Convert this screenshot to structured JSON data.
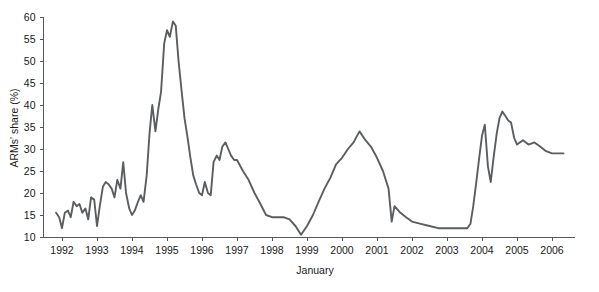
{
  "chart_data": {
    "type": "line",
    "title": "",
    "subtitle": "",
    "xlabel": "January",
    "ylabel": "ARMs' share (%)",
    "xlim": [
      1991.75,
      2006.6
    ],
    "ylim": [
      8.5,
      61.5
    ],
    "grid": false,
    "legend": null,
    "legend_position": "none",
    "line_color": "#5a5e60",
    "axis_color": "#55595c",
    "text_color": "#1a1a1a",
    "background_color": "#ffffff",
    "x_tick_labels": [
      "1992",
      "1993",
      "1994",
      "1995",
      "1996",
      "1997",
      "1998",
      "1999",
      "2000",
      "2001",
      "2002",
      "2003",
      "2004",
      "2005",
      "2006"
    ],
    "x_tick_values": [
      1992,
      1993,
      1994,
      1995,
      1996,
      1997,
      1998,
      1999,
      2000,
      2001,
      2002,
      2003,
      2004,
      2005,
      2006
    ],
    "y_tick_labels": [
      "10",
      "15",
      "20",
      "25",
      "30",
      "35",
      "40",
      "45",
      "50",
      "55",
      "60"
    ],
    "y_tick_values": [
      10,
      15,
      20,
      25,
      30,
      35,
      40,
      45,
      50,
      55,
      60
    ],
    "series": [
      {
        "name": "ARMs' share",
        "x": [
          1991.83,
          1991.92,
          1992.0,
          1992.08,
          1992.17,
          1992.25,
          1992.33,
          1992.42,
          1992.5,
          1992.58,
          1992.67,
          1992.75,
          1992.83,
          1992.92,
          1993.0,
          1993.08,
          1993.17,
          1993.25,
          1993.33,
          1993.42,
          1993.5,
          1993.58,
          1993.67,
          1993.75,
          1993.83,
          1993.92,
          1994.0,
          1994.08,
          1994.17,
          1994.25,
          1994.33,
          1994.42,
          1994.5,
          1994.58,
          1994.67,
          1994.75,
          1994.83,
          1994.92,
          1995.0,
          1995.08,
          1995.17,
          1995.25,
          1995.33,
          1995.42,
          1995.5,
          1995.58,
          1995.67,
          1995.75,
          1995.83,
          1995.92,
          1996.0,
          1996.08,
          1996.17,
          1996.25,
          1996.33,
          1996.42,
          1996.5,
          1996.58,
          1996.67,
          1996.75,
          1996.83,
          1996.92,
          1997.0,
          1997.17,
          1997.33,
          1997.5,
          1997.67,
          1997.83,
          1998.0,
          1998.17,
          1998.33,
          1998.5,
          1998.67,
          1998.83,
          1999.0,
          1999.17,
          1999.33,
          1999.5,
          1999.67,
          1999.83,
          2000.0,
          2000.17,
          2000.33,
          2000.5,
          2000.67,
          2000.83,
          2001.0,
          2001.17,
          2001.33,
          2001.42,
          2001.5,
          2001.67,
          2001.83,
          2002.0,
          2002.25,
          2002.5,
          2002.75,
          2003.0,
          2003.25,
          2003.5,
          2003.58,
          2003.67,
          2003.75,
          2003.83,
          2003.92,
          2004.0,
          2004.08,
          2004.17,
          2004.25,
          2004.33,
          2004.42,
          2004.5,
          2004.58,
          2004.67,
          2004.75,
          2004.83,
          2004.92,
          2005.0,
          2005.17,
          2005.33,
          2005.5,
          2005.67,
          2005.83,
          2006.0,
          2006.17,
          2006.33
        ],
        "values": [
          15.5,
          14.5,
          12.0,
          15.5,
          16.0,
          14.5,
          18.0,
          17.0,
          17.5,
          15.5,
          16.5,
          14.0,
          19.0,
          18.5,
          12.5,
          17.0,
          21.5,
          22.5,
          22.0,
          21.0,
          19.0,
          23.0,
          21.0,
          27.0,
          20.0,
          16.5,
          15.0,
          16.0,
          18.0,
          19.5,
          18.0,
          24.0,
          33.5,
          40.0,
          34.0,
          39.0,
          43.0,
          54.0,
          57.0,
          55.5,
          59.0,
          58.0,
          50.0,
          43.0,
          37.0,
          33.0,
          28.0,
          24.0,
          22.0,
          20.0,
          19.5,
          22.5,
          20.0,
          19.5,
          27.0,
          28.5,
          27.5,
          30.5,
          31.5,
          30.0,
          28.5,
          27.5,
          27.5,
          25.0,
          23.0,
          20.0,
          17.5,
          15.0,
          14.5,
          14.5,
          14.5,
          14.0,
          12.5,
          10.5,
          12.5,
          15.0,
          18.0,
          21.0,
          23.5,
          26.5,
          28.0,
          30.0,
          31.5,
          34.0,
          32.0,
          30.5,
          28.0,
          25.0,
          21.0,
          13.5,
          17.0,
          15.5,
          14.5,
          13.5,
          13.0,
          12.5,
          12.0,
          12.0,
          12.0,
          12.0,
          12.0,
          13.0,
          17.0,
          22.0,
          28.0,
          33.0,
          35.5,
          26.0,
          22.5,
          28.0,
          33.5,
          37.0,
          38.5,
          37.5,
          36.5,
          36.0,
          32.5,
          31.0,
          32.0,
          31.0,
          31.5,
          30.5,
          29.5,
          29.0,
          29.0,
          29.0
        ]
      }
    ]
  },
  "axis_titles": {
    "x": "January",
    "y": "ARMs' share (%)"
  }
}
